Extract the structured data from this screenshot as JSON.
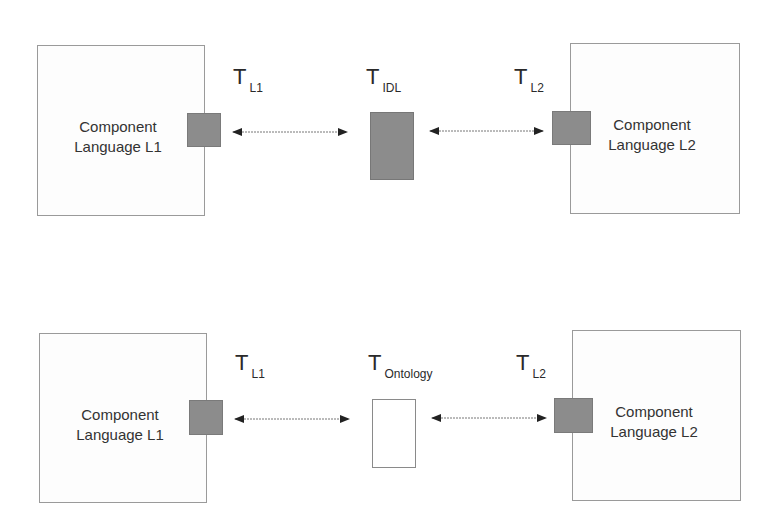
{
  "diagram": {
    "top_row": {
      "left_component": {
        "line1": "Component",
        "line2": "Language L1"
      },
      "right_component": {
        "line1": "Component",
        "line2": "Language L2"
      },
      "labels": {
        "t_left": {
          "main": "T",
          "sub": "L1"
        },
        "t_center": {
          "main": "T",
          "sub": "IDL"
        },
        "t_right": {
          "main": "T",
          "sub": "L2"
        }
      },
      "center_box": {
        "fill": "#8c8c8c",
        "kind": "filled"
      }
    },
    "bottom_row": {
      "left_component": {
        "line1": "Component",
        "line2": "Language L1"
      },
      "right_component": {
        "line1": "Component",
        "line2": "Language L2"
      },
      "labels": {
        "t_left": {
          "main": "T",
          "sub": "L1"
        },
        "t_center": {
          "main": "T",
          "sub": "Ontology"
        },
        "t_right": {
          "main": "T",
          "sub": "L2"
        }
      },
      "center_box": {
        "fill": "#ffffff",
        "kind": "outline"
      }
    },
    "colors": {
      "port": "#8c8c8c",
      "border": "#9a9a9a",
      "arrow": "#222222"
    }
  }
}
